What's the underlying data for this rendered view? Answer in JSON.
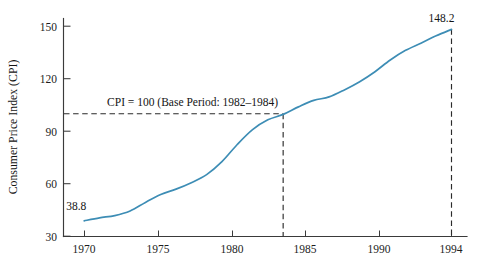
{
  "chart_data": {
    "type": "line",
    "title": "",
    "xlabel": "",
    "ylabel": "Consumer Price Index (CPI)",
    "xlim": [
      1969.0,
      1995.3
    ],
    "ylim": [
      30,
      157
    ],
    "grid": false,
    "legend": "none",
    "x_ticks": [
      1970,
      1975,
      1980,
      1985,
      1990,
      1994
    ],
    "x_tick_labels": [
      "1970",
      "1975",
      "1980",
      "1985",
      "1990",
      "1994"
    ],
    "y_ticks": [
      30,
      60,
      90,
      120,
      150
    ],
    "y_tick_labels": [
      "30",
      "60",
      "90",
      "120",
      "150"
    ],
    "series": [
      {
        "name": "Consumer Price Index (CPI)",
        "color": "#3d8db5",
        "x": [
          1970,
          1971,
          1972,
          1973,
          1974,
          1975,
          1976,
          1977,
          1978,
          1979,
          1980,
          1981,
          1982,
          1983,
          1984,
          1985,
          1986,
          1987,
          1988,
          1989,
          1990,
          1991,
          1992,
          1993,
          1994
        ],
        "values": [
          38.8,
          40.5,
          41.8,
          44.4,
          49.3,
          53.8,
          56.9,
          60.6,
          65.2,
          72.6,
          82.4,
          90.9,
          96.5,
          99.6,
          103.9,
          107.6,
          109.6,
          113.6,
          118.3,
          124.0,
          130.7,
          136.2,
          140.3,
          144.5,
          148.2
        ]
      }
    ],
    "annotations": [
      {
        "id": "start-value",
        "text": "38.8",
        "x": 1970,
        "y": 38.8,
        "placement": "above-left"
      },
      {
        "id": "end-value",
        "text": "148.2",
        "x": 1994,
        "y": 148.2,
        "placement": "above"
      },
      {
        "id": "base-period-note",
        "text": "CPI = 100 (Base Period: 1982–1984)",
        "x": 1971.3,
        "y": 104,
        "placement": "above-right"
      }
    ],
    "reference_lines": [
      {
        "id": "cpi-100-horizontal",
        "orientation": "horizontal",
        "value": 100,
        "from_x": 1969.0,
        "to_x": 1983,
        "style": "dashed"
      },
      {
        "id": "year-1983-vertical",
        "orientation": "vertical",
        "value": 1983,
        "from_y": 30,
        "to_y": 100,
        "style": "dashed"
      },
      {
        "id": "year-1994-vertical",
        "orientation": "vertical",
        "value": 1994,
        "from_y": 30,
        "to_y": 148.2,
        "style": "dashed"
      }
    ]
  },
  "axis": {
    "y_title": "Consumer Price Index (CPI)"
  },
  "labels": {
    "y_30": "30",
    "y_60": "60",
    "y_90": "90",
    "y_120": "120",
    "y_150": "150",
    "x_1970": "1970",
    "x_1975": "1975",
    "x_1980": "1980",
    "x_1985": "1985",
    "x_1990": "1990",
    "x_1994": "1994",
    "start_value": "38.8",
    "end_value": "148.2",
    "base_note": "CPI = 100 (Base Period: 1982–1984)"
  },
  "colors": {
    "curve": "#3d8db5",
    "axis": "#3a3a3a",
    "dash": "#2b2b2b",
    "text": "#1d1d1d",
    "background": "#ffffff"
  }
}
